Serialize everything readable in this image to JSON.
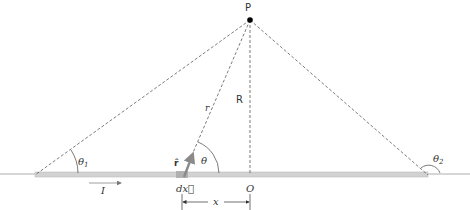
{
  "diagram": {
    "labels": {
      "point": "P",
      "perpendicular_distance": "R",
      "distance_vector": "r",
      "unit_vector": "r̂",
      "angle": "θ",
      "angle_1": "θ",
      "angle_1_sub": "1",
      "angle_2": "θ",
      "angle_2_sub": "2",
      "current": "I",
      "element": "dx⃗",
      "origin": "O",
      "x_distance": "x"
    },
    "colors": {
      "wire": "#cfcfcf",
      "wire_edge": "#b5b5b5",
      "lines": "#444444",
      "arrow": "#999999",
      "point": "#000000",
      "text": "#333333"
    }
  }
}
